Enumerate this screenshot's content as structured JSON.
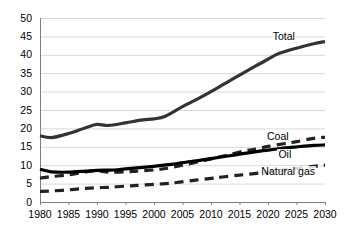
{
  "chart_data": {
    "type": "line",
    "title": "",
    "subtitle": "",
    "xlabel": "",
    "ylabel": "",
    "xlim": [
      1980,
      2030
    ],
    "ylim": [
      0,
      50
    ],
    "grid": true,
    "grid_axis": "y",
    "legend_position": "inline-right",
    "x": [
      1980,
      1985,
      1990,
      1995,
      2000,
      2005,
      2010,
      2015,
      2020,
      2025,
      2030
    ],
    "xticks": [
      "1980",
      "1985",
      "1990",
      "1995",
      "2000",
      "2005",
      "2010",
      "2015",
      "2020",
      "2025",
      "2030"
    ],
    "yticks": [
      "0",
      "5",
      "10",
      "15",
      "20",
      "25",
      "30",
      "35",
      "40",
      "45",
      "50"
    ],
    "series": [
      {
        "name": "Total",
        "label": "Total",
        "style": "solid",
        "color": "#333333",
        "width": 3.2,
        "x": [
          1980,
          1982,
          1985,
          1988,
          1990,
          1992,
          1995,
          1998,
          2000,
          2002,
          2005,
          2008,
          2010,
          2012,
          2015,
          2018,
          2020,
          2022,
          2025,
          2028,
          2030
        ],
        "values": [
          18.0,
          17.5,
          18.6,
          20.2,
          21.1,
          20.8,
          21.5,
          22.3,
          22.6,
          23.3,
          25.9,
          28.3,
          30.0,
          31.8,
          34.5,
          37.1,
          38.8,
          40.4,
          41.8,
          43.0,
          43.6
        ]
      },
      {
        "name": "Coal",
        "label": "Coal",
        "style": "dashed",
        "color": "#222222",
        "width": 3.2,
        "x": [
          1980,
          1982,
          1985,
          1988,
          1990,
          1992,
          1995,
          1997,
          2000,
          2002,
          2005,
          2008,
          2010,
          2013,
          2016,
          2018,
          2020,
          2023,
          2025,
          2028,
          2030
        ],
        "values": [
          6.5,
          6.9,
          7.4,
          8.2,
          8.5,
          8.1,
          8.2,
          8.4,
          8.7,
          9.1,
          10.0,
          11.0,
          11.7,
          12.8,
          13.9,
          14.4,
          15.1,
          15.9,
          16.4,
          17.3,
          17.6
        ]
      },
      {
        "name": "Oil",
        "label": "Oil",
        "style": "solid",
        "color": "#000000",
        "width": 3.2,
        "x": [
          1980,
          1982,
          1985,
          1988,
          1990,
          1993,
          1995,
          1998,
          2000,
          2003,
          2005,
          2008,
          2010,
          2013,
          2015,
          2018,
          2020,
          2023,
          2025,
          2028,
          2030
        ],
        "values": [
          8.9,
          8.2,
          8.1,
          8.4,
          8.6,
          8.7,
          9.0,
          9.4,
          9.7,
          10.2,
          10.7,
          11.3,
          11.8,
          12.5,
          13.0,
          13.7,
          14.1,
          14.7,
          15.0,
          15.4,
          15.5
        ]
      },
      {
        "name": "Natural gas",
        "label": "Natural gas",
        "style": "dashed",
        "color": "#222222",
        "width": 3.2,
        "x": [
          1980,
          1982,
          1985,
          1988,
          1990,
          1992,
          1995,
          1997,
          2000,
          2002,
          2004,
          2007,
          2010,
          2012,
          2015,
          2018,
          2020,
          2022,
          2025,
          2028,
          2030
        ],
        "values": [
          2.9,
          3.0,
          3.3,
          3.7,
          3.9,
          4.0,
          4.3,
          4.5,
          4.8,
          5.0,
          5.3,
          5.9,
          6.4,
          6.8,
          7.3,
          7.8,
          8.1,
          8.6,
          9.1,
          9.7,
          10.0
        ]
      }
    ],
    "annotations": [
      {
        "name": "total-label",
        "text": "Total",
        "x": 2021,
        "y": 45.0
      },
      {
        "name": "coal-label",
        "text": "Coal",
        "x": 2020,
        "y": 17.8
      },
      {
        "name": "oil-label",
        "text": "Oil",
        "x": 2022,
        "y": 13.0
      },
      {
        "name": "natural-gas-label",
        "text": "Natural gas",
        "x": 2019,
        "y": 8.2
      }
    ],
    "colors": {
      "gridline": "#d9d9d9",
      "axis": "#808080",
      "total": "#333333",
      "coal": "#222222",
      "oil": "#000000",
      "natural_gas": "#222222",
      "background": "#ffffff",
      "text": "#000000"
    }
  }
}
